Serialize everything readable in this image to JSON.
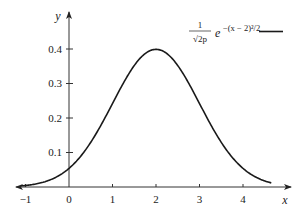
{
  "chart_data": {
    "type": "line",
    "title": "",
    "xlabel": "x",
    "ylabel": "y",
    "xlim": [
      -1,
      4.8
    ],
    "ylim": [
      0,
      0.45
    ],
    "x_ticks": [
      "-1",
      "0",
      "1",
      "2",
      "3",
      "4"
    ],
    "y_ticks": [
      "0.1",
      "0.2",
      "0.3",
      "0.4"
    ],
    "grid": false,
    "legend_position": "upper right",
    "series": [
      {
        "name": "1/√(2p) e^{-(x-2)^2/2}",
        "function": "normal pdf, mean 2, sd 1",
        "x": [
          -1,
          -0.5,
          0,
          0.5,
          1,
          1.5,
          2,
          2.5,
          3,
          3.5,
          4,
          4.5
        ],
        "values": [
          0.0044,
          0.0175,
          0.054,
          0.1295,
          0.242,
          0.3521,
          0.3989,
          0.3521,
          0.242,
          0.1295,
          0.054,
          0.0175
        ]
      }
    ]
  },
  "legend": {
    "numerator": "1",
    "denominator": "√2p",
    "exponent_base": "e",
    "exponent": "−(x − 2)²/2"
  },
  "axes": {
    "x_label": "x",
    "y_label": "y"
  },
  "ticks": {
    "x": [
      {
        "label": "−1",
        "value": -1
      },
      {
        "label": "0",
        "value": 0
      },
      {
        "label": "1",
        "value": 1
      },
      {
        "label": "2",
        "value": 2
      },
      {
        "label": "3",
        "value": 3
      },
      {
        "label": "4",
        "value": 4
      }
    ],
    "y": [
      {
        "label": "0.1",
        "value": 0.1
      },
      {
        "label": "0.2",
        "value": 0.2
      },
      {
        "label": "0.3",
        "value": 0.3
      },
      {
        "label": "0.4",
        "value": 0.4
      }
    ]
  }
}
